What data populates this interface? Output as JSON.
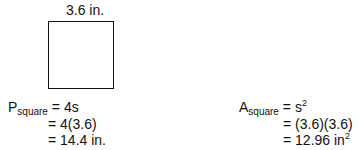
{
  "figure": {
    "shape": "square",
    "side_label": "3.6 in."
  },
  "perimeter": {
    "symbol": "P",
    "subscript": "square",
    "lines": [
      "=  4s",
      "=  4(3.6)",
      "=  14.4 in."
    ]
  },
  "area": {
    "symbol": "A",
    "subscript": "square",
    "line1_prefix": "=  s",
    "line1_sup": "2",
    "line2": "= (3.6)(3.6)",
    "line3_prefix": "= 12.96 in",
    "line3_sup": "2"
  }
}
